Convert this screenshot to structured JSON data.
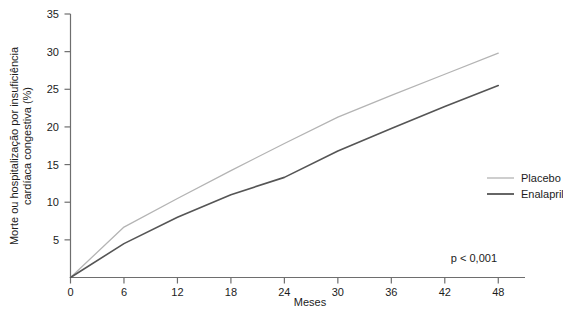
{
  "chart_data": {
    "type": "line",
    "title": "",
    "xlabel": "Meses",
    "ylabel": "Morte ou hospitalização por insuficiência cardíaca congestiva (%)",
    "ylabel_line1": "Morte ou hospitalização por insuficiência",
    "ylabel_line2": "cardíaca congestiva (%)",
    "x": [
      0,
      6,
      12,
      18,
      24,
      30,
      36,
      42,
      48
    ],
    "xlim": [
      0,
      51
    ],
    "ylim": [
      0,
      35
    ],
    "xticks": [
      "0",
      "6",
      "12",
      "18",
      "24",
      "30",
      "36",
      "42",
      "48"
    ],
    "xtick_values": [
      0,
      6,
      12,
      18,
      24,
      30,
      36,
      42,
      48
    ],
    "yticks": [
      "5",
      "10",
      "15",
      "20",
      "25",
      "30",
      "35"
    ],
    "ytick_values": [
      5,
      10,
      15,
      20,
      25,
      30,
      35
    ],
    "grid": false,
    "legend_position": "right-middle",
    "series": [
      {
        "name": "Placebo",
        "color": "#b4b4b4",
        "values": [
          0,
          6.7,
          10.5,
          14.2,
          17.8,
          21.3,
          24.2,
          27.0,
          29.8
        ]
      },
      {
        "name": "Enalapril",
        "color": "#555555",
        "values": [
          0,
          4.5,
          8.0,
          11.0,
          13.3,
          16.8,
          19.8,
          22.7,
          25.5
        ]
      }
    ],
    "annotations": [
      {
        "text": "p < 0,001",
        "x": 42,
        "y": 2.2
      }
    ]
  },
  "legend": {
    "items": [
      {
        "label": "Placebo",
        "color": "#b4b4b4"
      },
      {
        "label": "Enalapril",
        "color": "#555555"
      }
    ]
  },
  "axes": {
    "x_title": "Meses",
    "y_title_line1": "Morte ou hospitalização por insuficiência",
    "y_title_line2": "cardíaca congestiva (%)"
  },
  "annotation": {
    "pvalue": "p < 0,001"
  },
  "colors": {
    "axis": "#6e6e6e",
    "text": "#1c1c1c",
    "placebo": "#b4b4b4",
    "enalapril": "#555555",
    "background": "#ffffff"
  }
}
